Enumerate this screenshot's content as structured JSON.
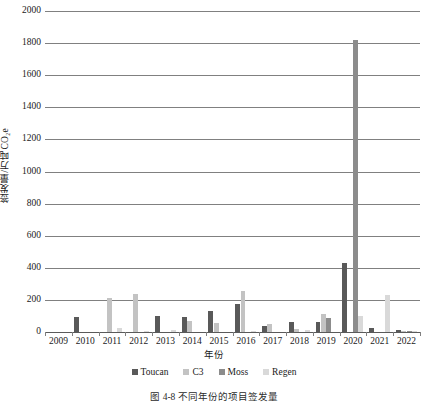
{
  "chart_data": {
    "type": "bar",
    "title": "",
    "xlabel": "年份",
    "ylabel": "签发量/万吨CO₂e",
    "ylabel_plain": "签发量/万吨CO2e",
    "categories": [
      "2009",
      "2010",
      "2011",
      "2012",
      "2013",
      "2014",
      "2015",
      "2016",
      "2017",
      "2018",
      "2019",
      "2020",
      "2021",
      "2022"
    ],
    "series": [
      {
        "name": "Toucan",
        "color": "#595959",
        "values": [
          0,
          95,
          0,
          0,
          100,
          92,
          130,
          175,
          40,
          62,
          65,
          430,
          25,
          10
        ]
      },
      {
        "name": "C3",
        "color": "#c3c3c3",
        "values": [
          0,
          0,
          210,
          235,
          0,
          70,
          55,
          255,
          50,
          20,
          115,
          0,
          0,
          5
        ]
      },
      {
        "name": "Moss",
        "color": "#8c8c8c",
        "values": [
          0,
          0,
          0,
          0,
          0,
          0,
          0,
          0,
          0,
          0,
          85,
          1820,
          0,
          8
        ]
      },
      {
        "name": "Regen",
        "color": "#d9d9d9",
        "values": [
          0,
          0,
          22,
          8,
          10,
          0,
          0,
          8,
          0,
          15,
          0,
          100,
          230,
          8
        ]
      }
    ],
    "ylim": [
      0,
      2000
    ],
    "ytick_step": 200,
    "yticks": [
      0,
      200,
      400,
      600,
      800,
      1000,
      1200,
      1400,
      1600,
      1800,
      2000
    ],
    "grid": "horizontal",
    "legend_position": "bottom"
  },
  "legend": {
    "entries": [
      {
        "label": "Toucan",
        "color": "#595959"
      },
      {
        "label": "C3",
        "color": "#c3c3c3"
      },
      {
        "label": "Moss",
        "color": "#8c8c8c"
      },
      {
        "label": "Regen",
        "color": "#d9d9d9"
      }
    ]
  },
  "caption": {
    "text": "图 4-8  不同年份的项目签发量"
  }
}
